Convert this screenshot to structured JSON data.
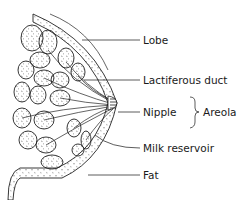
{
  "diagram": {
    "labels": [
      {
        "id": "lobe",
        "text": "Lobe",
        "x": 143,
        "y": 35
      },
      {
        "id": "lactiferous-duct",
        "text": "Lactiferous duct",
        "x": 143,
        "y": 75
      },
      {
        "id": "nipple",
        "text": "Nipple",
        "x": 143,
        "y": 107
      },
      {
        "id": "areola",
        "text": "Areola",
        "x": 203,
        "y": 107
      },
      {
        "id": "milk-reservoir",
        "text": "Milk reservoir",
        "x": 143,
        "y": 143
      },
      {
        "id": "fat",
        "text": "Fat",
        "x": 143,
        "y": 170
      }
    ],
    "colors": {
      "line": "#222222",
      "text": "#1a1a1a",
      "background": "#ffffff"
    }
  }
}
